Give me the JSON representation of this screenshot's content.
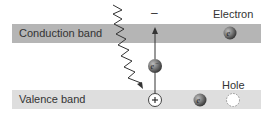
{
  "bands": {
    "conduction": {
      "label": "Conduction band",
      "color": "#b5b5b5"
    },
    "valence": {
      "label": "Valence band",
      "color": "#dedede"
    }
  },
  "labels": {
    "electron": "Electron",
    "hole": "Hole",
    "minus": "–",
    "plus": "+"
  },
  "particles": {
    "electron_symbol": "e",
    "excited_electron_symbol": "e⁻",
    "electron_color": "#6e6e6e"
  },
  "photon": {
    "description": "wavy incoming photon arrow"
  }
}
